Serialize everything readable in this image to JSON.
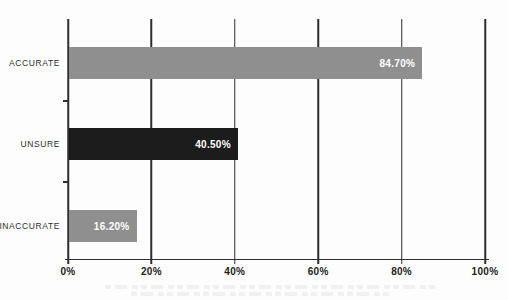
{
  "chart_data": {
    "type": "bar",
    "orientation": "horizontal",
    "title": "",
    "xlabel": "",
    "ylabel": "",
    "categories": [
      "ACCURATE",
      "UNSURE",
      "INACCURATE"
    ],
    "values": [
      84.7,
      40.5,
      16.2
    ],
    "value_labels": [
      "84.70%",
      "40.50%",
      "16.20%"
    ],
    "bar_colors": [
      "#8f8f8f",
      "#1c1c1c",
      "#8f8f8f"
    ],
    "x_ticks": [
      "0%",
      "20%",
      "40%",
      "60%",
      "80%",
      "100%"
    ],
    "xlim": [
      0,
      100
    ],
    "grid": true,
    "gridline_color": "#2e2e2e",
    "value_label_color": "#ffffff",
    "category_label_color": "#2f2f2f",
    "background_color": "#fdfdfd",
    "legend": "none"
  }
}
